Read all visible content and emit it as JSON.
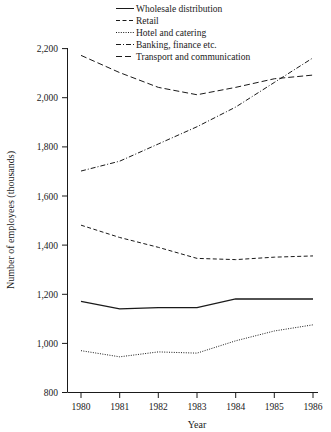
{
  "chart_data": {
    "type": "line",
    "title": "",
    "xlabel": "Year",
    "ylabel": "Number of employees (thousands)",
    "x": [
      1980,
      1981,
      1982,
      1983,
      1984,
      1985,
      1986
    ],
    "xtick_labels": [
      "1980",
      "1981",
      "1982",
      "1983",
      "1984",
      "1985",
      "1986"
    ],
    "ytick_labels": [
      "800",
      "1,000",
      "1,200",
      "1,400",
      "1,600",
      "1,800",
      "2,000",
      "2,200"
    ],
    "yticks": [
      800,
      1000,
      1200,
      1400,
      1600,
      1800,
      2000,
      2200
    ],
    "ylim": [
      800,
      2200
    ],
    "xlim": [
      1980,
      1986
    ],
    "grid": false,
    "legend_position": "top-right",
    "series": [
      {
        "name": "Wholesale distribution",
        "style": "solid",
        "color": "#1a1a1a",
        "values": [
          1170,
          1140,
          1145,
          1145,
          1180,
          1180,
          1180
        ]
      },
      {
        "name": "Retail",
        "style": "dashed",
        "color": "#1a1a1a",
        "values": [
          1480,
          1430,
          1390,
          1345,
          1340,
          1350,
          1355
        ]
      },
      {
        "name": "Hotel and catering",
        "style": "dotted",
        "color": "#1a1a1a",
        "values": [
          970,
          945,
          965,
          960,
          1010,
          1050,
          1075
        ]
      },
      {
        "name": "Banking, finance etc.",
        "style": "dash-dot",
        "color": "#1a1a1a",
        "values": [
          1700,
          1740,
          1810,
          1880,
          1960,
          2060,
          2160
        ]
      },
      {
        "name": "Transport and communication",
        "style": "long-dash",
        "color": "#1a1a1a",
        "values": [
          2170,
          2100,
          2040,
          2010,
          2040,
          2075,
          2090
        ]
      }
    ]
  },
  "legend": {
    "entries": [
      {
        "label": "Wholesale distribution",
        "style": "solid"
      },
      {
        "label": "Retail",
        "style": "dashed"
      },
      {
        "label": "Hotel and catering",
        "style": "dotted"
      },
      {
        "label": "Banking, finance etc.",
        "style": "dash-dot"
      },
      {
        "label": "Transport and communication",
        "style": "long-dash"
      }
    ]
  }
}
